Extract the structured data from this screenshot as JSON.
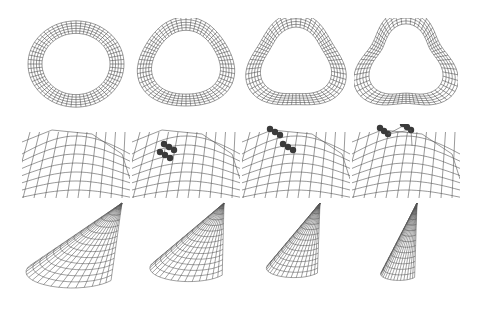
{
  "figure": {
    "layout": {
      "rows": 3,
      "columns": 4
    },
    "background": "#ffffff",
    "line_color": "#555555",
    "marker_color": "#3a3a3a",
    "rows": [
      {
        "name": "torus-deformation",
        "description": "wireframe torus progressively deformed into a triangular ring",
        "panels": [
          {
            "index": 1,
            "shape": "torus",
            "deformation": 0.0
          },
          {
            "index": 2,
            "shape": "torus",
            "deformation": 0.33
          },
          {
            "index": 3,
            "shape": "torus",
            "deformation": 0.66
          },
          {
            "index": 4,
            "shape": "torus",
            "deformation": 1.0
          }
        ]
      },
      {
        "name": "mesh-with-control-points",
        "description": "close-up wireframe mesh with dark spherical control points being moved",
        "panels": [
          {
            "index": 1,
            "control_points": 0
          },
          {
            "index": 2,
            "control_points": 6
          },
          {
            "index": 3,
            "control_points": 6
          },
          {
            "index": 4,
            "control_points": 6
          }
        ]
      },
      {
        "name": "cone-tapering",
        "description": "wireframe cone progressively narrowed",
        "panels": [
          {
            "index": 1,
            "shape": "cone",
            "base_width": 1.0
          },
          {
            "index": 2,
            "shape": "cone",
            "base_width": 0.85
          },
          {
            "index": 3,
            "shape": "cone",
            "base_width": 0.6
          },
          {
            "index": 4,
            "shape": "cone",
            "base_width": 0.4
          }
        ]
      }
    ]
  }
}
